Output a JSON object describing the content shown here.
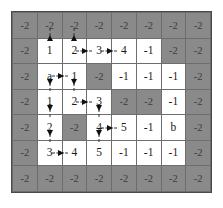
{
  "figure": {
    "colors": {
      "wall_fill": "#8a8a8a",
      "open_fill": "#ffffff",
      "grid_line": "#6d6d6d",
      "border": "#4a4a4a",
      "arrow": "#111111",
      "text": "#111111"
    },
    "rows": 7,
    "cols": 8
  },
  "chart_data": {
    "type": "heatmap",
    "title": "",
    "xlabel": "",
    "ylabel": "",
    "legend": [],
    "rows": 7,
    "cols": 8,
    "cell_labels": [
      [
        "-2",
        "-2",
        "-2",
        "-2",
        "-2",
        "-2",
        "-2",
        "-2"
      ],
      [
        "-2",
        "1",
        "2",
        "3",
        "4",
        "-1",
        "-2",
        "-2"
      ],
      [
        "-2",
        "a",
        "1",
        "-2",
        "-1",
        "-1",
        "-1",
        "-2"
      ],
      [
        "-2",
        "1",
        "2",
        "3",
        "-2",
        "-2",
        "-1",
        "-2"
      ],
      [
        "-2",
        "2",
        "-2",
        "4",
        "5",
        "-1",
        "b",
        "-2"
      ],
      [
        "-2",
        "3",
        "4",
        "5",
        "-1",
        "-1",
        "-1",
        "-2"
      ],
      [
        "-2",
        "-2",
        "-2",
        "-2",
        "-2",
        "-2",
        "-2",
        "-2"
      ]
    ],
    "cell_types": [
      [
        "wall",
        "wall",
        "wall",
        "wall",
        "wall",
        "wall",
        "wall",
        "wall"
      ],
      [
        "wall",
        "open",
        "open",
        "open",
        "open",
        "open",
        "wall",
        "wall"
      ],
      [
        "wall",
        "open",
        "open",
        "wall",
        "open",
        "open",
        "open",
        "wall"
      ],
      [
        "wall",
        "open",
        "open",
        "open",
        "wall",
        "wall",
        "open",
        "wall"
      ],
      [
        "wall",
        "open",
        "wall",
        "open",
        "open",
        "open",
        "open",
        "wall"
      ],
      [
        "wall",
        "open",
        "open",
        "open",
        "open",
        "open",
        "open",
        "wall"
      ],
      [
        "wall",
        "wall",
        "wall",
        "wall",
        "wall",
        "wall",
        "wall",
        "wall"
      ]
    ],
    "arrows": [
      {
        "row": 1,
        "col": 1,
        "dir": "up"
      },
      {
        "row": 1,
        "col": 2,
        "dir": "up"
      },
      {
        "row": 1,
        "col": 2,
        "dir": "right"
      },
      {
        "row": 1,
        "col": 3,
        "dir": "right"
      },
      {
        "row": 2,
        "col": 1,
        "dir": "right"
      },
      {
        "row": 2,
        "col": 1,
        "dir": "down"
      },
      {
        "row": 2,
        "col": 2,
        "dir": "down"
      },
      {
        "row": 3,
        "col": 2,
        "dir": "right"
      },
      {
        "row": 3,
        "col": 1,
        "dir": "down"
      },
      {
        "row": 3,
        "col": 3,
        "dir": "down"
      },
      {
        "row": 4,
        "col": 1,
        "dir": "down"
      },
      {
        "row": 4,
        "col": 3,
        "dir": "down"
      },
      {
        "row": 4,
        "col": 3,
        "dir": "right"
      },
      {
        "row": 5,
        "col": 1,
        "dir": "right"
      }
    ],
    "start_label": "a",
    "goal_label": "b",
    "wall_value": "-2",
    "unvisited_value": "-1"
  }
}
